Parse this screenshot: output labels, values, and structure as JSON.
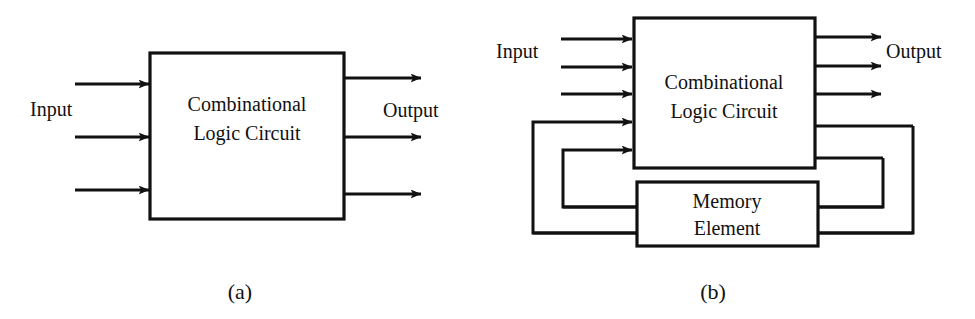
{
  "figure": {
    "type": "block-diagram",
    "background_color": "#ffffff",
    "line_color": "#111111"
  },
  "panel_a": {
    "caption": "(a)",
    "input_label": "Input",
    "output_label": "Output",
    "block": {
      "line1": "Combinational",
      "line2": "Logic Circuit"
    },
    "input_arrow_count": 3,
    "output_arrow_count": 3
  },
  "panel_b": {
    "caption": "(b)",
    "input_label": "Input",
    "output_label": "Output",
    "logic_block": {
      "line1": "Combinational",
      "line2": "Logic Circuit"
    },
    "memory_block": {
      "line1": "Memory",
      "line2": "Element"
    },
    "input_arrow_count": 3,
    "output_arrow_count": 3,
    "feedback_loop_count": 2
  }
}
